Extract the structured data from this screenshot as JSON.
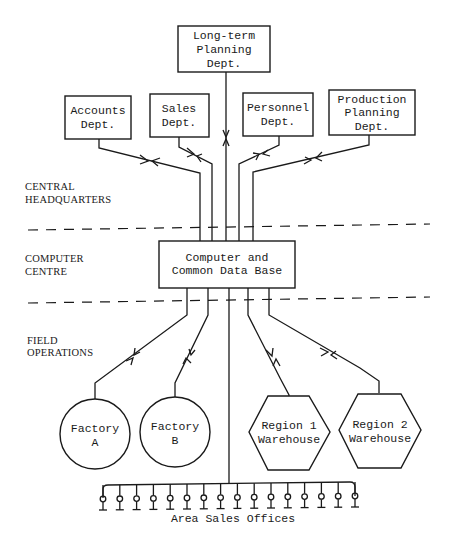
{
  "diagram": {
    "zones": [
      {
        "id": "hq",
        "label_line1": "CENTRAL",
        "label_line2": "HEADQUARTERS"
      },
      {
        "id": "cc",
        "label_line1": "COMPUTER",
        "label_line2": "CENTRE"
      },
      {
        "id": "field",
        "label_line1": "FIELD",
        "label_line2": "OPERATIONS"
      }
    ],
    "departments": {
      "longterm": {
        "line1": "Long-term",
        "line2": "Planning",
        "line3": "Dept."
      },
      "accounts": {
        "line1": "Accounts",
        "line2": "Dept."
      },
      "sales": {
        "line1": "Sales",
        "line2": "Dept."
      },
      "personnel": {
        "line1": "Personnel",
        "line2": "Dept."
      },
      "production": {
        "line1": "Production",
        "line2": "Planning",
        "line3": "Dept."
      }
    },
    "computer": {
      "line1": "Computer and",
      "line2": "Common Data Base"
    },
    "factories": [
      {
        "line1": "Factory",
        "line2": "A"
      },
      {
        "line1": "Factory",
        "line2": "B"
      }
    ],
    "warehouses": [
      {
        "line1": "Region 1",
        "line2": "Warehouse"
      },
      {
        "line1": "Region 2",
        "line2": "Warehouse"
      }
    ],
    "sales_offices": {
      "label": "Area Sales Offices",
      "count": 16
    }
  }
}
